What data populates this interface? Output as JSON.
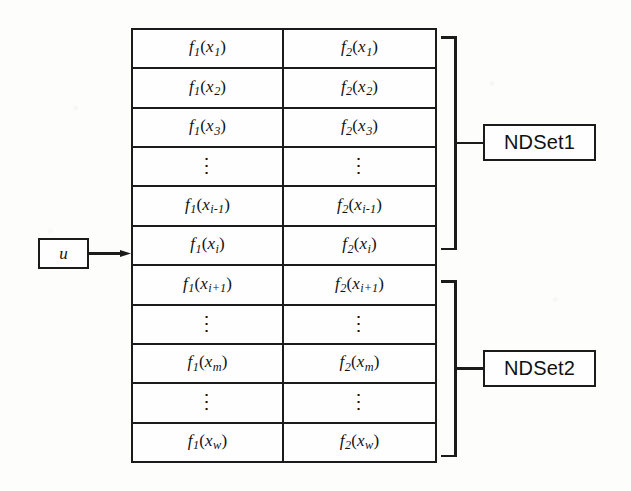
{
  "figure": {
    "type": "diagram",
    "background_color": "#fdfdfc",
    "line_color": "#1b1b1b"
  },
  "input_node": {
    "label": "u",
    "arrow_name": "insertion-arrow",
    "points_to_row_boundary_between": [
      6,
      7
    ]
  },
  "table": {
    "columns": [
      "f1",
      "f2"
    ],
    "row_count": 11,
    "rows": [
      {
        "kind": "value",
        "index": "1",
        "col1": "f₁(x₁)",
        "col2": "f₂(x₁)"
      },
      {
        "kind": "value",
        "index": "2",
        "col1": "f₁(x₂)",
        "col2": "f₂(x₂)"
      },
      {
        "kind": "value",
        "index": "3",
        "col1": "f₁(x₃)",
        "col2": "f₂(x₃)"
      },
      {
        "kind": "ellipsis",
        "index": "",
        "col1": "⋮",
        "col2": "⋮"
      },
      {
        "kind": "value",
        "index": "i-1",
        "col1": "f₁(xᵢ₋₁)",
        "col2": "f₂(xᵢ₋₁)"
      },
      {
        "kind": "value",
        "index": "i",
        "col1": "f₁(xᵢ)",
        "col2": "f₂(xᵢ)"
      },
      {
        "kind": "value",
        "index": "i+1",
        "col1": "f₁(xᵢ₊₁)",
        "col2": "f₂(xᵢ₊₁)"
      },
      {
        "kind": "ellipsis",
        "index": "",
        "col1": "⋮",
        "col2": "⋮"
      },
      {
        "kind": "value",
        "index": "m",
        "col1": "f₁(xₘ)",
        "col2": "f₂(xₘ)"
      },
      {
        "kind": "ellipsis",
        "index": "",
        "col1": "⋮",
        "col2": "⋮"
      },
      {
        "kind": "value",
        "index": "w",
        "col1": "f₁(x_w)",
        "col2": "f₂(x_w)"
      }
    ]
  },
  "groups": [
    {
      "id": "ndset1",
      "label": "NDSet1",
      "covers_rows": [
        1,
        6
      ]
    },
    {
      "id": "ndset2",
      "label": "NDSet2",
      "covers_rows": [
        7,
        11
      ]
    }
  ]
}
